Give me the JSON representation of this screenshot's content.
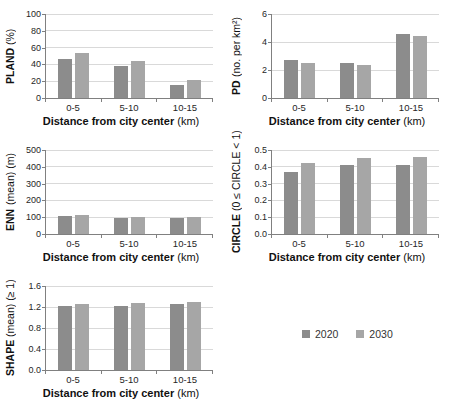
{
  "figure": {
    "title": "",
    "legend": {
      "position": "bottom-right",
      "items": [
        {
          "label": "2020",
          "color": "#8c8c8c"
        },
        {
          "label": "2030",
          "color": "#a6a6a6"
        }
      ]
    },
    "colors": {
      "series_2020": "#8c8c8c",
      "series_2030": "#a6a6a6",
      "gridline": "#d9d9d9",
      "axis": "#808080",
      "text": "#262626"
    }
  },
  "chart_data": [
    {
      "id": "pland",
      "type": "bar",
      "panel": "top-left",
      "ylabel_main": "PLAND",
      "ylabel_unit": "(%)",
      "xlabel_main": "Distance from city center",
      "xlabel_unit": "(km)",
      "categories": [
        "0-5",
        "5-10",
        "10-15"
      ],
      "ylim": [
        0,
        100
      ],
      "yticks": [
        0,
        20,
        40,
        60,
        80,
        100
      ],
      "ytick_labels": [
        "0",
        "20",
        "40",
        "60",
        "80",
        "100"
      ],
      "grid": true,
      "series": [
        {
          "name": "2020",
          "values": [
            46,
            38,
            15
          ]
        },
        {
          "name": "2030",
          "values": [
            53,
            44,
            21
          ]
        }
      ]
    },
    {
      "id": "pd",
      "type": "bar",
      "panel": "top-right",
      "ylabel_main": "PD",
      "ylabel_unit": "(no. per km²)",
      "xlabel_main": "Distance from city center",
      "xlabel_unit": "(km)",
      "categories": [
        "0-5",
        "5-10",
        "10-15"
      ],
      "ylim": [
        0,
        6
      ],
      "yticks": [
        0,
        2,
        4,
        6
      ],
      "ytick_labels": [
        "0",
        "2",
        "4",
        "6"
      ],
      "grid": true,
      "series": [
        {
          "name": "2020",
          "values": [
            2.7,
            2.5,
            4.6
          ]
        },
        {
          "name": "2030",
          "values": [
            2.5,
            2.35,
            4.4
          ]
        }
      ]
    },
    {
      "id": "enn",
      "type": "bar",
      "panel": "middle-left",
      "ylabel_main": "ENN",
      "ylabel_unit": "(mean) (m)",
      "xlabel_main": "Distance from city center",
      "xlabel_unit": "(km)",
      "categories": [
        "0-5",
        "5-10",
        "10-15"
      ],
      "ylim": [
        0,
        500
      ],
      "yticks": [
        0,
        100,
        200,
        300,
        400,
        500
      ],
      "ytick_labels": [
        "0",
        "100",
        "200",
        "300",
        "400",
        "500"
      ],
      "grid": true,
      "series": [
        {
          "name": "2020",
          "values": [
            105,
            97,
            97
          ]
        },
        {
          "name": "2030",
          "values": [
            112,
            101,
            103
          ]
        }
      ]
    },
    {
      "id": "circle",
      "type": "bar",
      "panel": "middle-right",
      "ylabel_main": "CIRCLE",
      "ylabel_unit": "(0 ≤ CIRCLE < 1)",
      "xlabel_main": "Distance from city center",
      "xlabel_unit": "(km)",
      "categories": [
        "0-5",
        "5-10",
        "10-15"
      ],
      "ylim": [
        0,
        0.5
      ],
      "yticks": [
        0,
        0.1,
        0.2,
        0.3,
        0.4,
        0.5
      ],
      "ytick_labels": [
        "0.0",
        "0.1",
        "0.2",
        "0.3",
        "0.4",
        "0.5"
      ],
      "grid": true,
      "series": [
        {
          "name": "2020",
          "values": [
            0.37,
            0.41,
            0.41
          ]
        },
        {
          "name": "2030",
          "values": [
            0.42,
            0.45,
            0.46
          ]
        }
      ]
    },
    {
      "id": "shape",
      "type": "bar",
      "panel": "bottom-left",
      "ylabel_main": "SHAPE",
      "ylabel_unit": "(mean) (≥ 1)",
      "xlabel_main": "Distance from city center",
      "xlabel_unit": "(km)",
      "categories": [
        "0-5",
        "5-10",
        "10-15"
      ],
      "ylim": [
        0,
        1.6
      ],
      "yticks": [
        0,
        0.4,
        0.8,
        1.2,
        1.6
      ],
      "ytick_labels": [
        "0.0",
        "0.4",
        "0.8",
        "1.2",
        "1.6"
      ],
      "grid": true,
      "series": [
        {
          "name": "2020",
          "values": [
            1.22,
            1.22,
            1.26
          ]
        },
        {
          "name": "2030",
          "values": [
            1.26,
            1.27,
            1.3
          ]
        }
      ]
    }
  ]
}
